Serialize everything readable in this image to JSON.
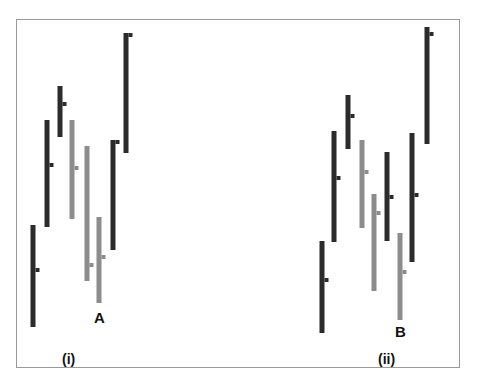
{
  "chart_data": {
    "type": "ohlc-bar",
    "title": "",
    "colors": {
      "up": "#2b2b2b",
      "down": "#8c8c8c",
      "frame": "#9a9a9a"
    },
    "panels": [
      {
        "label": "(i)",
        "annotation": {
          "text": "A",
          "bar_index": 5
        },
        "bars": [
          {
            "x": 33,
            "high": 225,
            "low": 327,
            "close": 270,
            "color": "dark"
          },
          {
            "x": 47,
            "high": 120,
            "low": 227,
            "close": 165,
            "color": "dark"
          },
          {
            "x": 60,
            "high": 86,
            "low": 137,
            "close": 104,
            "color": "dark"
          },
          {
            "x": 72,
            "high": 120,
            "low": 219,
            "close": 168,
            "color": "gray"
          },
          {
            "x": 87,
            "high": 146,
            "low": 281,
            "close": 265,
            "color": "gray"
          },
          {
            "x": 99,
            "high": 217,
            "low": 303,
            "close": 257,
            "color": "gray"
          },
          {
            "x": 113,
            "high": 140,
            "low": 250,
            "close": 142,
            "color": "dark"
          },
          {
            "x": 126,
            "high": 33,
            "low": 153,
            "close": 35,
            "color": "dark"
          }
        ]
      },
      {
        "label": "(ii)",
        "annotation": {
          "text": "B",
          "bar_index": 6
        },
        "bars": [
          {
            "x": 322,
            "high": 241,
            "low": 333,
            "close": 280,
            "color": "dark"
          },
          {
            "x": 334,
            "high": 131,
            "low": 242,
            "close": 178,
            "color": "dark"
          },
          {
            "x": 348,
            "high": 95,
            "low": 149,
            "close": 116,
            "color": "dark"
          },
          {
            "x": 362,
            "high": 140,
            "low": 228,
            "close": 172,
            "color": "gray"
          },
          {
            "x": 374,
            "high": 194,
            "low": 291,
            "close": 213,
            "color": "gray"
          },
          {
            "x": 387,
            "high": 152,
            "low": 241,
            "close": 197,
            "color": "dark"
          },
          {
            "x": 400,
            "high": 233,
            "low": 320,
            "close": 272,
            "color": "gray"
          },
          {
            "x": 412,
            "high": 133,
            "low": 262,
            "close": 195,
            "color": "dark"
          },
          {
            "x": 427,
            "high": 27,
            "low": 144,
            "close": 34,
            "color": "dark"
          }
        ]
      }
    ],
    "xlabel": "",
    "ylabel": "",
    "grid": false,
    "legend": null
  },
  "labels": {
    "panel_i": "(i)",
    "panel_ii": "(ii)",
    "point_a": "A",
    "point_b": "B"
  }
}
